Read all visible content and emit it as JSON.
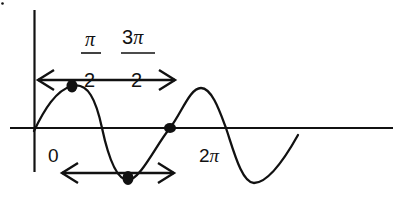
{
  "diagram": {
    "type": "sine-wave-graph",
    "colors": {
      "stroke": "#111111",
      "background": "#ffffff"
    },
    "labels": {
      "origin": "0",
      "two_pi_coef": "2",
      "two_pi_sym": "π",
      "pi_over_2_num": "π",
      "pi_over_2_den": "2",
      "three_pi_over_2_coef": "3",
      "three_pi_over_2_sym": "π",
      "three_pi_over_2_den": "2"
    },
    "arrows": [
      {
        "name": "upper-double-arrow",
        "y": 80,
        "x_start": 38,
        "x_end": 175
      },
      {
        "name": "lower-double-arrow",
        "y": 173,
        "x_start": 62,
        "x_end": 174
      }
    ],
    "points": [
      {
        "name": "max-point",
        "x": 72,
        "y": 86
      },
      {
        "name": "min-point",
        "x": 128,
        "y": 178
      },
      {
        "name": "zero-crossing-point",
        "x": 170,
        "y": 128
      }
    ]
  }
}
